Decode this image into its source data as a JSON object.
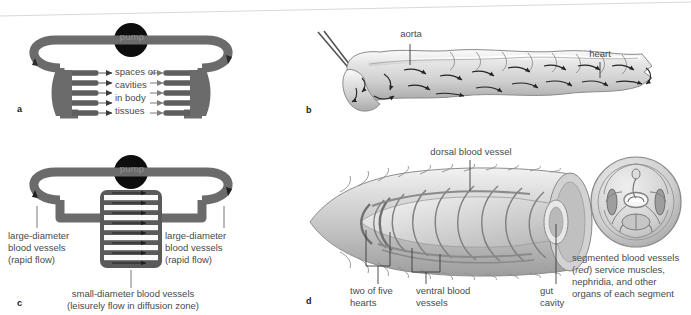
{
  "figure": {
    "background_color": "#ffffff",
    "vessel_color": "#6b6b6b",
    "vessel_dark_color": "#4f4f4f",
    "pump_color": "#0d0d0d",
    "label_color": "#4a4a4a",
    "arrow_color": "#2a2a2a"
  },
  "panels": {
    "a": {
      "letter": "a",
      "pump_label": "pump",
      "tissue_label_lines": [
        "spaces or",
        "cavities",
        "in body",
        "tissues"
      ],
      "branch_count": 5,
      "description": "open circulatory system schematic"
    },
    "b": {
      "letter": "b",
      "labels": {
        "aorta": "aorta",
        "heart": "heart"
      },
      "description": "insect body with open circulation, dorsal heart and aorta"
    },
    "c": {
      "letter": "c",
      "pump_label": "pump",
      "left_label_lines": [
        "large-diameter",
        "blood vessels",
        "(rapid flow)"
      ],
      "right_label_lines": [
        "large-diameter",
        "blood vessels",
        "(rapid flow)"
      ],
      "bottom_label_lines": [
        "small-diameter blood vessels",
        "(leisurely flow in diffusion zone)"
      ],
      "capillary_count": 7,
      "description": "closed circulatory system schematic"
    },
    "d": {
      "letter": "d",
      "labels": {
        "dorsal": "dorsal blood vessel",
        "hearts_lines": [
          "two of five",
          "hearts"
        ],
        "ventral_lines": [
          "ventral blood",
          "vessels"
        ],
        "gut_lines": [
          "gut",
          "cavity"
        ]
      },
      "caption_lines": [
        "segmented blood vessels",
        "(red) service muscles,",
        "nephridia, and other",
        "organs of each segment"
      ],
      "caption_italic_word": "red",
      "description": "earthworm cutaway with segmented vessels and cross-section"
    }
  }
}
